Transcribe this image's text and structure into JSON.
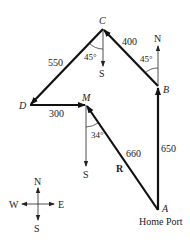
{
  "diagram": {
    "points": {
      "A": {
        "label": "A",
        "sublabel": "Home Port"
      },
      "B": {
        "label": "B"
      },
      "C": {
        "label": "C"
      },
      "D": {
        "label": "D"
      },
      "M": {
        "label": "M"
      }
    },
    "vectors": [
      {
        "from": "A",
        "to": "B",
        "length": "650"
      },
      {
        "from": "B",
        "to": "C",
        "length": "400",
        "angle": "45°"
      },
      {
        "from": "C",
        "to": "D",
        "length": "550",
        "angle": "45°"
      },
      {
        "from": "D",
        "to": "M",
        "length": "300"
      },
      {
        "from": "A",
        "to": "M",
        "length": "660",
        "name": "R",
        "angle": "34°"
      }
    ],
    "reference_labels": {
      "north_at_B": "N",
      "south_at_C": "S",
      "south_at_M": "S"
    },
    "compass": {
      "N": "N",
      "S": "S",
      "E": "E",
      "W": "W"
    }
  }
}
